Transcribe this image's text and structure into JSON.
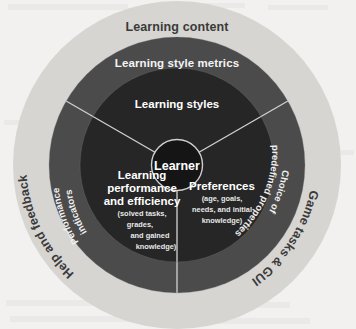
{
  "diagram": {
    "type": "concentric-ring-diagram",
    "background_color": "#f2f1ef",
    "rings": [
      {
        "id": "outer",
        "name": "outer-ring",
        "color": "#d6d5d2",
        "text_color": "#3a3a3a",
        "labels": [
          {
            "id": "learning-content",
            "text": "Learning content",
            "position": "top"
          },
          {
            "id": "game-tasks-gui",
            "text": "Game tasks & GUI",
            "position": "right"
          },
          {
            "id": "help-and-feedback",
            "text": "Help and feedback",
            "position": "left"
          }
        ]
      },
      {
        "id": "middle",
        "name": "middle-ring",
        "color": "#4b4b4b",
        "text_color": "#f4f4f4",
        "labels": [
          {
            "id": "learning-style-metrics",
            "text": "Learning style metrics",
            "position": "top"
          },
          {
            "id": "choice-of-predefined-properties",
            "text": "Choice of",
            "text2": "predefined properties",
            "position": "right"
          },
          {
            "id": "performance-indicators",
            "text": "Performance",
            "text2": "indicators",
            "position": "left"
          }
        ]
      },
      {
        "id": "inner",
        "name": "inner-disc",
        "color": "#262626",
        "text_color": "#ffffff",
        "sectors": [
          {
            "id": "learning-styles",
            "title": "Learning styles",
            "sub": []
          },
          {
            "id": "learning-performance-and-efficiency",
            "title_lines": [
              "Learning",
              "performance",
              "and efficiency"
            ],
            "sub": [
              "(solved tasks,",
              "grades,",
              "and gained",
              "knowledge)"
            ]
          },
          {
            "id": "preferences",
            "title_lines": [
              "Preferences"
            ],
            "sub": [
              "(age, goals,",
              "needs, and initial",
              "knowledge)"
            ]
          }
        ]
      }
    ],
    "core": {
      "id": "learner",
      "name": "core-circle",
      "label": "Learner",
      "color": "#151515",
      "outline_color": "#cfcfcf",
      "text_color": "#ffffff"
    },
    "dividers": {
      "color": "#cfcfcf",
      "count": 3,
      "angles_deg": [
        90,
        210,
        330
      ]
    }
  }
}
